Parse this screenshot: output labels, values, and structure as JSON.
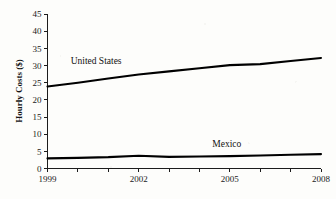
{
  "chart_data": {
    "type": "line",
    "title": "",
    "xlabel": "",
    "ylabel": "Hourly Costs ($)",
    "x": [
      1999,
      2000,
      2001,
      2002,
      2003,
      2004,
      2005,
      2006,
      2007,
      2008
    ],
    "xlim": [
      1999,
      2008
    ],
    "ylim": [
      0,
      45
    ],
    "ytick_values": [
      0,
      5,
      10,
      15,
      20,
      25,
      30,
      35,
      40,
      45
    ],
    "ytick_labels": [
      "0",
      "5",
      "10",
      "15",
      "20",
      "25",
      "30",
      "35",
      "40",
      "45"
    ],
    "xtick_values": [
      1999,
      2000,
      2001,
      2002,
      2003,
      2004,
      2005,
      2006,
      2007,
      2008
    ],
    "xtick_labels": [
      "1999",
      "",
      "",
      "2002",
      "",
      "",
      "2005",
      "",
      "",
      "2008"
    ],
    "grid": false,
    "legend": "inline-annotations",
    "series": [
      {
        "name": "United States",
        "color": "#000000",
        "values": [
          23.9,
          25.0,
          26.2,
          27.4,
          28.3,
          29.2,
          30.1,
          30.4,
          31.3,
          32.2
        ],
        "annotation": {
          "text": "United States",
          "x": 2000.6,
          "y": 30.5
        }
      },
      {
        "name": "Mexico",
        "color": "#000000",
        "values": [
          2.95,
          3.1,
          3.3,
          3.7,
          3.4,
          3.5,
          3.6,
          3.8,
          4.0,
          4.2
        ],
        "annotation": {
          "text": "Mexico",
          "x": 2004.9,
          "y": 6.2
        }
      }
    ]
  }
}
